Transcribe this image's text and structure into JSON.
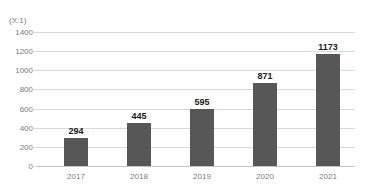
{
  "chart_data": {
    "type": "bar",
    "title": "",
    "subtitle": "",
    "unit_caption": "(X:1)",
    "xlabel": "",
    "ylabel": "",
    "categories": [
      "2017",
      "2018",
      "2019",
      "2020",
      "2021"
    ],
    "values": [
      294,
      445,
      595,
      871,
      1173
    ],
    "data_labels": [
      "294",
      "445",
      "595",
      "871",
      "1173"
    ],
    "ylim": [
      0,
      1400
    ],
    "ytick_values": [
      0,
      200,
      400,
      600,
      800,
      1000,
      1200,
      1400
    ],
    "ytick_labels": [
      "0",
      "200",
      "400",
      "600",
      "800",
      "1000",
      "1200",
      "1400"
    ],
    "grid": true,
    "grid_axis": "y",
    "legend": false,
    "legend_position": "none",
    "series": [
      {
        "name": "",
        "values": [
          294,
          445,
          595,
          871,
          1173
        ],
        "color": "#575757"
      }
    ],
    "colors": {
      "bar": "#575757",
      "gridline": "#d9d9d9",
      "baseline": "#c4c4c4",
      "tick_text": "#7b7b7b",
      "data_label_text": "#1a1a1a",
      "background": "#ffffff"
    }
  }
}
